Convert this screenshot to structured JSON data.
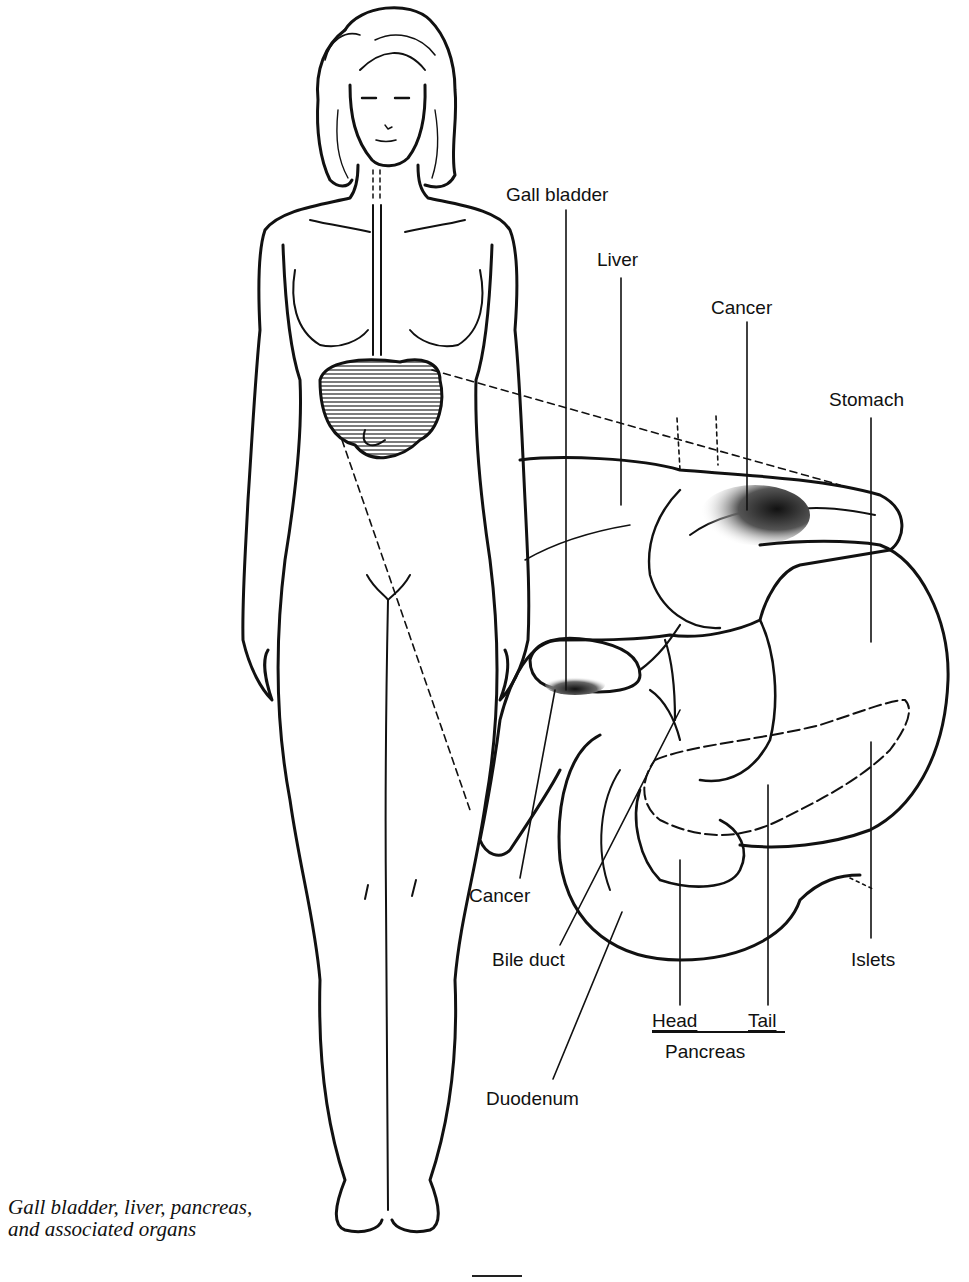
{
  "figure": {
    "type": "anatomical line illustration",
    "colors": {
      "ink": "#111111",
      "background": "#ffffff",
      "shading": "#333333"
    }
  },
  "labels": {
    "gall_bladder": "Gall bladder",
    "liver": "Liver",
    "cancer_top": "Cancer",
    "stomach": "Stomach",
    "cancer_bottom": "Cancer",
    "bile_duct": "Bile duct",
    "islets": "Islets",
    "head": "Head",
    "tail": "Tail",
    "pancreas": "Pancreas",
    "duodenum": "Duodenum"
  },
  "caption": {
    "line1": "Gall bladder, liver, pancreas,",
    "line2": "and associated organs"
  }
}
